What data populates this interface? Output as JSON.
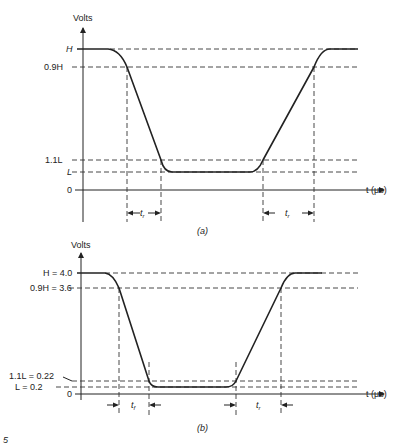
{
  "figure": {
    "panels": [
      {
        "id": "a",
        "caption": "(a)",
        "y_axis_label": "Volts",
        "x_axis_label": "t (μs)",
        "levels": [
          {
            "label": "H",
            "value": "H"
          },
          {
            "label": "0.9H",
            "value": "0.9H"
          },
          {
            "label": "1.1L",
            "value": "1.1L"
          },
          {
            "label": "L",
            "value": "L"
          },
          {
            "label": "0",
            "value": "0"
          }
        ],
        "intervals": [
          {
            "label": "t_r",
            "display": "t",
            "sub": "r"
          },
          {
            "label": "t_r",
            "display": "t",
            "sub": "r"
          }
        ]
      },
      {
        "id": "b",
        "caption": "(b)",
        "y_axis_label": "Volts",
        "x_axis_label": "t (μs)",
        "levels": [
          {
            "label": "H = 4.0",
            "value": 4.0
          },
          {
            "label": "0.9H = 3.6",
            "value": 3.6
          },
          {
            "label": "1.1L = 0.22",
            "value": 0.22
          },
          {
            "label": "L = 0.2",
            "value": 0.2
          },
          {
            "label": "0",
            "value": 0
          }
        ],
        "intervals": [
          {
            "label": "t_f",
            "display": "t",
            "sub": "f"
          },
          {
            "label": "t_r",
            "display": "t",
            "sub": "r"
          }
        ]
      }
    ],
    "corner_mark": "5"
  }
}
